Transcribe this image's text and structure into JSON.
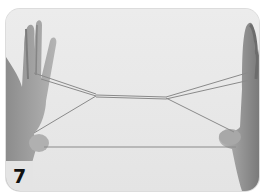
{
  "figure": {
    "step_number": "7",
    "colors": {
      "background": "#e9e9e9",
      "hand": "#9a9a9a",
      "hand_dark": "#6e6e6e",
      "string": "#8a8a8a"
    }
  }
}
